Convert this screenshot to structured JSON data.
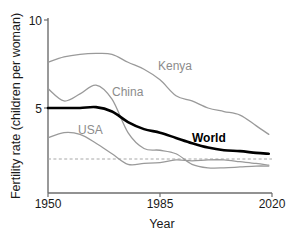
{
  "chart_data": {
    "type": "line",
    "title": "",
    "xlabel": "Year",
    "ylabel": "Fertility rate (children per woman)",
    "xlim": [
      1950,
      2020
    ],
    "ylim": [
      0,
      10
    ],
    "xticks": [
      1950,
      1985,
      2020
    ],
    "xticklabels": [
      "1950",
      "1985",
      "2020"
    ],
    "yticks": [
      5,
      10
    ],
    "yticklabels": [
      "5",
      "10"
    ],
    "grid": false,
    "legend": "inline-labels",
    "annotations": [
      {
        "text": "Kenya",
        "x": 1985,
        "y": 6.6,
        "color": "#8c8c8c"
      },
      {
        "text": "China",
        "x": 1971,
        "y": 5.1,
        "color": "#8c8c8c"
      },
      {
        "text": "USA",
        "x": 1960,
        "y": 3.0,
        "color": "#8c8c8c"
      },
      {
        "text": "World",
        "x": 2000,
        "y": 2.5,
        "color": "#000000"
      }
    ],
    "reference_line": {
      "label": "replacement level",
      "y": 2.1,
      "style": "dashed",
      "color": "#a8a8a8"
    },
    "x": [
      1950,
      1955,
      1960,
      1965,
      1970,
      1975,
      1980,
      1985,
      1990,
      1995,
      2000,
      2005,
      2010,
      2015,
      2019
    ],
    "series": [
      {
        "name": "Kenya",
        "color": "#9a9a9a",
        "values": [
          7.6,
          7.9,
          8.05,
          8.1,
          8.05,
          7.6,
          7.2,
          6.6,
          5.7,
          5.4,
          5.0,
          4.8,
          4.6,
          4.0,
          3.5
        ]
      },
      {
        "name": "China",
        "color": "#9a9a9a",
        "values": [
          6.1,
          5.4,
          5.8,
          6.3,
          5.5,
          3.6,
          2.7,
          2.6,
          2.4,
          1.8,
          1.6,
          1.6,
          1.65,
          1.7,
          1.7
        ]
      },
      {
        "name": "USA",
        "color": "#9a9a9a",
        "values": [
          3.3,
          3.6,
          3.5,
          3.0,
          2.4,
          1.8,
          1.85,
          1.9,
          2.05,
          2.0,
          2.05,
          2.05,
          1.95,
          1.85,
          1.75
        ]
      },
      {
        "name": "World",
        "color": "#000000",
        "values": [
          5.0,
          5.0,
          5.0,
          5.05,
          4.8,
          4.2,
          3.8,
          3.6,
          3.3,
          3.0,
          2.75,
          2.6,
          2.55,
          2.45,
          2.4
        ]
      }
    ]
  },
  "axis": {
    "y_title": "Fertility rate (children per woman)",
    "x_title": "Year",
    "y_tick_10": "10",
    "y_tick_5": "5",
    "x_tick_1950": "1950",
    "x_tick_1985": "1985",
    "x_tick_2020": "2020"
  },
  "labels": {
    "kenya": "Kenya",
    "china": "China",
    "usa": "USA",
    "world": "World"
  }
}
